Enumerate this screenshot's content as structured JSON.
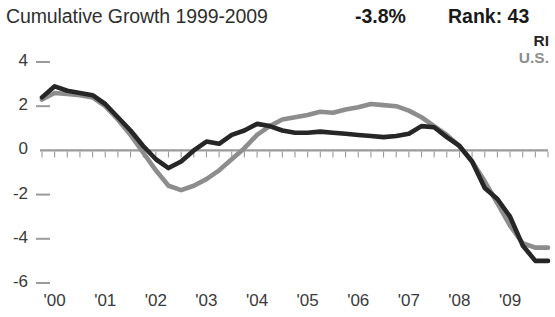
{
  "header": {
    "title": "Cumulative Growth 1999-2009",
    "stat_value": "-3.8%",
    "rank_label": "Rank: 43"
  },
  "legend": {
    "position": "top-right",
    "entries": [
      {
        "label": "RI",
        "color": "#262626"
      },
      {
        "label": "U.S.",
        "color": "#8d8d8d"
      }
    ]
  },
  "colors": {
    "ri_line": "#262626",
    "us_line": "#8d8d8d",
    "axis": "#9a9a9a",
    "text": "#2f2f2f",
    "background": "#ffffff"
  },
  "chart_data": {
    "type": "line",
    "title": "Cumulative Growth 1999-2009",
    "xlabel": "",
    "ylabel": "",
    "ylim": [
      -6,
      4
    ],
    "xlim": [
      1999.75,
      2009.75
    ],
    "ytick_labels": [
      "4",
      "2",
      "0",
      "-2",
      "-4",
      "-6"
    ],
    "ytick_values": [
      4,
      2,
      0,
      -2,
      -4,
      -6
    ],
    "xtick_labels": [
      "'00",
      "'01",
      "'02",
      "'03",
      "'04",
      "'05",
      "'06",
      "'07",
      "'08",
      "'09"
    ],
    "xtick_values": [
      2000,
      2001,
      2002,
      2003,
      2004,
      2005,
      2006,
      2007,
      2008,
      2009
    ],
    "grid": false,
    "minor_ticks": "quarterly",
    "zero_line": true,
    "x": [
      1999.75,
      2000.0,
      2000.25,
      2000.5,
      2000.75,
      2001.0,
      2001.25,
      2001.5,
      2001.75,
      2002.0,
      2002.25,
      2002.5,
      2002.75,
      2003.0,
      2003.25,
      2003.5,
      2003.75,
      2004.0,
      2004.25,
      2004.5,
      2004.75,
      2005.0,
      2005.25,
      2005.5,
      2005.75,
      2006.0,
      2006.25,
      2006.5,
      2006.75,
      2007.0,
      2007.25,
      2007.5,
      2007.75,
      2008.0,
      2008.25,
      2008.5,
      2008.75,
      2009.0,
      2009.25,
      2009.5,
      2009.75
    ],
    "series": [
      {
        "name": "RI",
        "color": "#262626",
        "values": [
          2.4,
          2.9,
          2.7,
          2.6,
          2.5,
          2.1,
          1.5,
          0.9,
          0.2,
          -0.4,
          -0.8,
          -0.5,
          0.0,
          0.4,
          0.3,
          0.7,
          0.9,
          1.2,
          1.1,
          0.9,
          0.8,
          0.8,
          0.85,
          0.8,
          0.75,
          0.7,
          0.65,
          0.6,
          0.65,
          0.75,
          1.1,
          1.05,
          0.6,
          0.2,
          -0.5,
          -1.7,
          -2.2,
          -3.0,
          -4.3,
          -5.0,
          -5.0
        ]
      },
      {
        "name": "U.S.",
        "color": "#8d8d8d",
        "values": [
          2.3,
          2.6,
          2.55,
          2.5,
          2.4,
          2.0,
          1.4,
          0.7,
          -0.1,
          -0.9,
          -1.6,
          -1.8,
          -1.6,
          -1.3,
          -0.9,
          -0.4,
          0.1,
          0.7,
          1.1,
          1.4,
          1.5,
          1.6,
          1.75,
          1.7,
          1.85,
          1.95,
          2.1,
          2.05,
          2.0,
          1.8,
          1.5,
          1.1,
          0.7,
          0.2,
          -0.5,
          -1.4,
          -2.4,
          -3.4,
          -4.2,
          -4.4,
          -4.4
        ]
      }
    ]
  }
}
